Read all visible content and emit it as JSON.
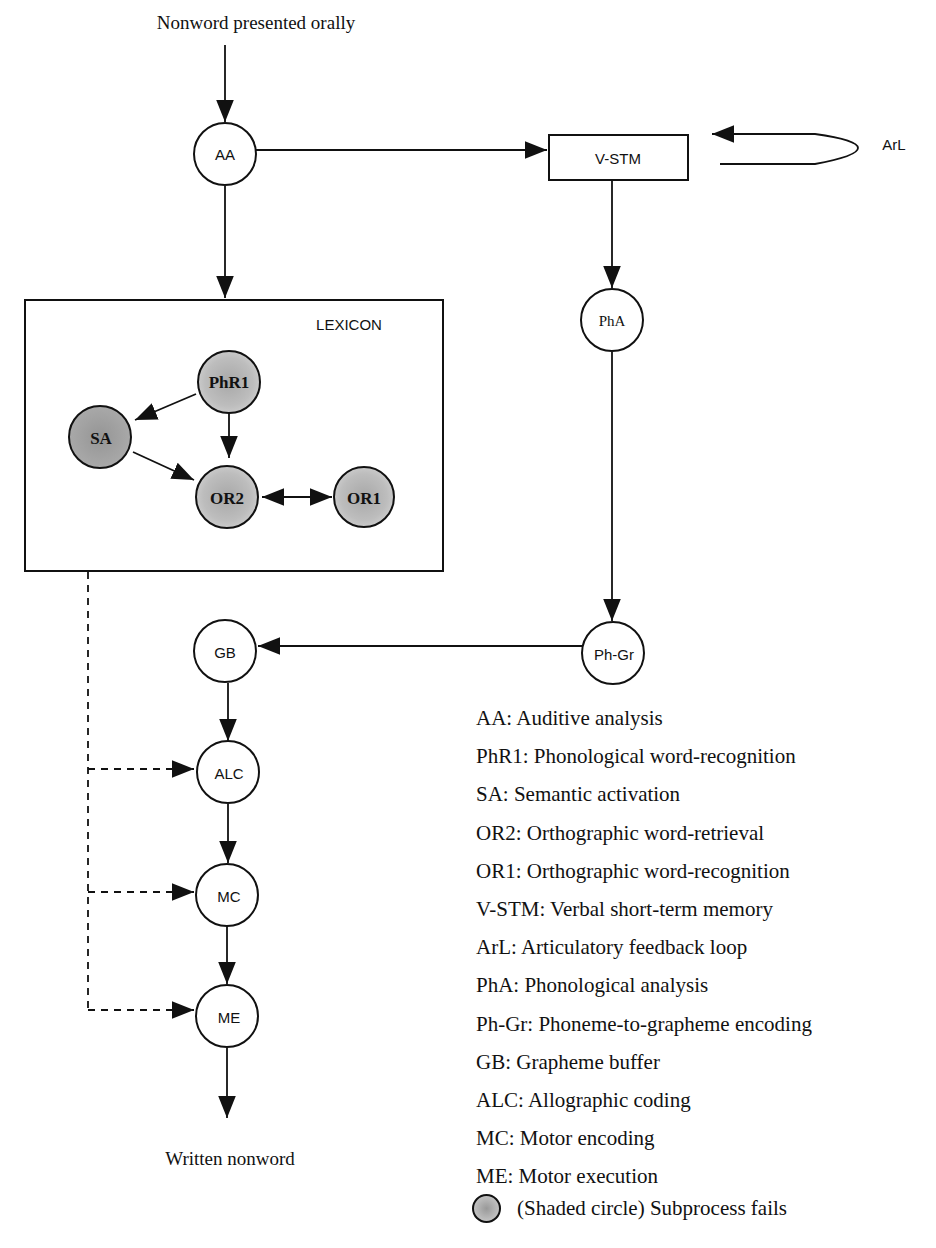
{
  "diagram": {
    "input_label": "Nonword presented orally",
    "output_label": "Written nonword",
    "lexicon_label": "LEXICON",
    "nodes": {
      "AA": "AA",
      "VSTM": "V-STM",
      "ArL": "ArL",
      "PhA": "PhA",
      "PhR1": "PhR1",
      "SA": "SA",
      "OR2": "OR2",
      "OR1": "OR1",
      "PhGr": "Ph-Gr",
      "GB": "GB",
      "ALC": "ALC",
      "MC": "MC",
      "ME": "ME"
    },
    "shaded_nodes": [
      "PhR1",
      "SA",
      "OR2",
      "OR1"
    ],
    "edges": [
      {
        "from": "input",
        "to": "AA",
        "style": "solid"
      },
      {
        "from": "AA",
        "to": "V-STM",
        "style": "solid"
      },
      {
        "from": "AA",
        "to": "LEXICON",
        "style": "solid"
      },
      {
        "from": "V-STM",
        "to": "ArL",
        "style": "solid",
        "note": "feedback loop back to V-STM"
      },
      {
        "from": "V-STM",
        "to": "PhA",
        "style": "solid"
      },
      {
        "from": "PhA",
        "to": "Ph-Gr",
        "style": "solid"
      },
      {
        "from": "Ph-Gr",
        "to": "GB",
        "style": "solid"
      },
      {
        "from": "PhR1",
        "to": "SA",
        "style": "solid"
      },
      {
        "from": "PhR1",
        "to": "OR2",
        "style": "solid"
      },
      {
        "from": "SA",
        "to": "OR2",
        "style": "solid"
      },
      {
        "from": "OR2",
        "to": "OR1",
        "style": "solid-bidirectional"
      },
      {
        "from": "GB",
        "to": "ALC",
        "style": "solid"
      },
      {
        "from": "ALC",
        "to": "MC",
        "style": "solid"
      },
      {
        "from": "MC",
        "to": "ME",
        "style": "solid"
      },
      {
        "from": "ME",
        "to": "output",
        "style": "solid"
      },
      {
        "from": "LEXICON",
        "to": "ALC",
        "style": "dashed"
      },
      {
        "from": "LEXICON",
        "to": "MC",
        "style": "dashed"
      },
      {
        "from": "LEXICON",
        "to": "ME",
        "style": "dashed"
      }
    ],
    "colors": {
      "line": "#111111",
      "shaded_fill": "#b8b8b8",
      "shaded_fill_dark": "#9a9a9a",
      "background": "#ffffff"
    }
  },
  "legend": {
    "items": [
      "AA: Auditive analysis",
      "PhR1: Phonological word-recognition",
      "SA: Semantic activation",
      "OR2: Orthographic word-retrieval",
      "OR1: Orthographic word-recognition",
      "V-STM: Verbal short-term memory",
      "ArL: Articulatory feedback loop",
      "PhA: Phonological analysis",
      "Ph-Gr: Phoneme-to-grapheme encoding",
      "GB: Grapheme buffer",
      "ALC: Allographic coding",
      "MC: Motor encoding",
      "ME: Motor execution"
    ],
    "shaded_note": "(Shaded circle) Subprocess fails"
  }
}
